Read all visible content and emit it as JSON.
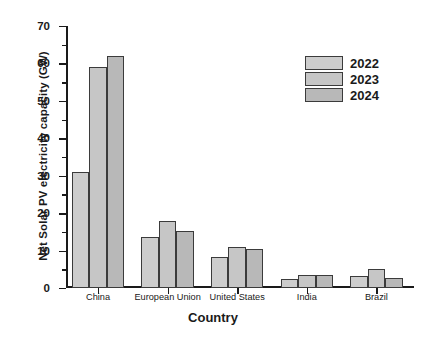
{
  "chart_data": {
    "type": "bar",
    "title": "",
    "xlabel": "Country",
    "ylabel": "Net Solar PV electricity capacity (GW)",
    "categories": [
      "China",
      "European Union",
      "United States",
      "India",
      "Brazil"
    ],
    "series": [
      {
        "name": "2022",
        "values": [
          31,
          13.7,
          8.3,
          2.3,
          3.1
        ],
        "color": "#cdcdcd"
      },
      {
        "name": "2023",
        "values": [
          59,
          18.0,
          11.0,
          3.6,
          5.2
        ],
        "color": "#c6c6c6"
      },
      {
        "name": "2024",
        "values": [
          62,
          15.3,
          10.3,
          3.5,
          2.6
        ],
        "color": "#b8b8b8"
      }
    ],
    "ylim": [
      0,
      70
    ],
    "yticks": [
      0,
      10,
      20,
      30,
      40,
      50,
      60,
      70
    ],
    "yminorticks": [
      5,
      15,
      25,
      35,
      45,
      55,
      65
    ],
    "grid": false,
    "legend_position": "top-right",
    "axis_color": "#1a1a1a",
    "bar_edge_color": "#3b3b3b",
    "background": "#ffffff"
  },
  "legend": {
    "entries": [
      {
        "label": "2022"
      },
      {
        "label": "2023"
      },
      {
        "label": "2024"
      }
    ]
  }
}
